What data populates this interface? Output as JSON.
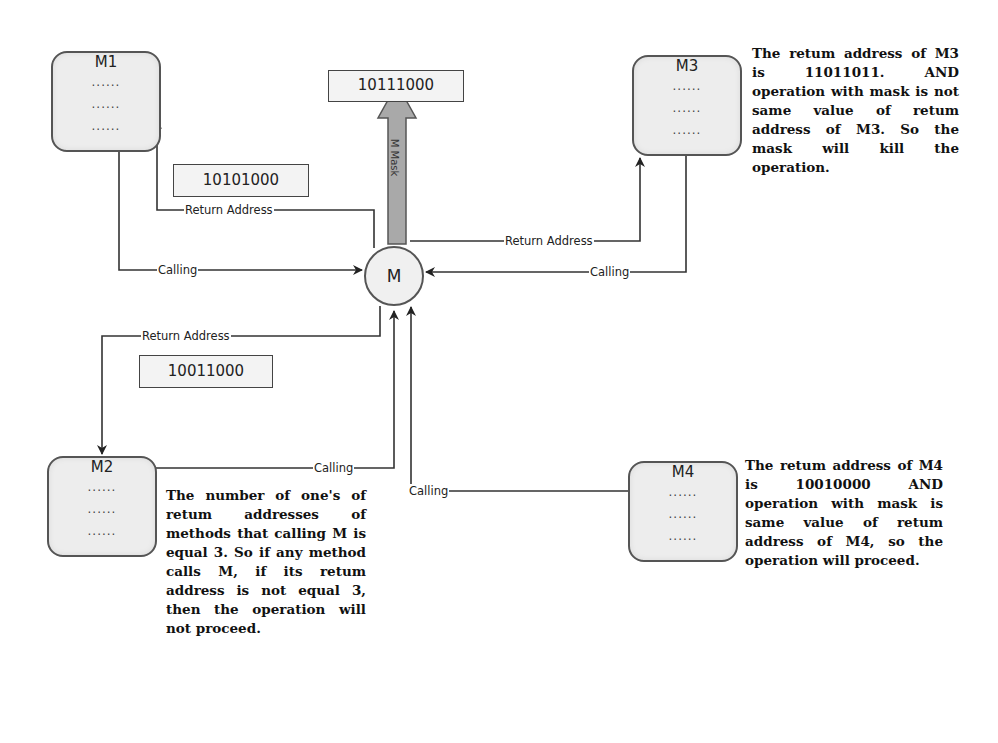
{
  "diagram": {
    "center_node": {
      "label": "M"
    },
    "mask": {
      "arrow_label": "M Mask",
      "value": "10111000"
    },
    "nodes": [
      {
        "id": "M1",
        "title": "M1",
        "lines": [
          "......",
          "......",
          "......"
        ]
      },
      {
        "id": "M2",
        "title": "M2",
        "lines": [
          "......",
          "......",
          "......"
        ]
      },
      {
        "id": "M3",
        "title": "M3",
        "lines": [
          "......",
          "......",
          "......"
        ]
      },
      {
        "id": "M4",
        "title": "M4",
        "lines": [
          "......",
          "......",
          "......"
        ]
      }
    ],
    "value_boxes": {
      "m1_return": "10101000",
      "m2_return": "10011000"
    },
    "edge_labels": {
      "m1_return": "Return Address",
      "m1_calling": "Calling",
      "m3_return": "Return Address",
      "m3_calling": "Calling",
      "m2_return": "Return Address",
      "m2_calling": "Calling",
      "m4_calling": "Calling"
    },
    "notes": {
      "m3": "The retum address of M3 is 11011011. AND operation with mask is not same value of retum address of M3. So the mask will kill the operation.",
      "m2": "The number of one's of retum addresses of methods that calling M is equal 3. So if any method calls M, if its retum address is not equal 3, then the operation will not proceed.",
      "m4": "The retum address of M4 is 10010000 AND operation with mask is same value of retum address of M4, so the operation will proceed."
    }
  }
}
